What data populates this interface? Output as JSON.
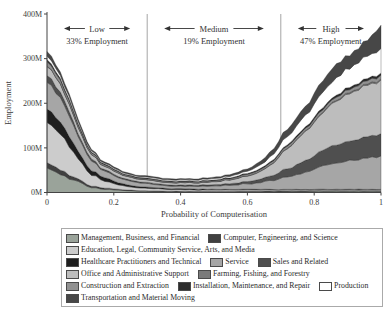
{
  "figure": {
    "annotations": [
      {
        "label": "Low",
        "sub": "33% Employment",
        "x_start": 0.0,
        "x_end": 0.3
      },
      {
        "label": "Medium",
        "sub": "19% Employment",
        "x_start": 0.3,
        "x_end": 0.7
      },
      {
        "label": "High",
        "sub": "47% Employment",
        "x_start": 0.7,
        "x_end": 1.0
      }
    ]
  },
  "chart_data": {
    "type": "area",
    "stacked": true,
    "title": "",
    "xlabel": "Probability of Computerisation",
    "ylabel": "Employment",
    "xlim": [
      0,
      1
    ],
    "ylim": [
      0,
      400
    ],
    "grid": false,
    "legend_position": "bottom",
    "dividers_x": [
      0.3,
      0.7
    ],
    "x_ticks": [
      {
        "v": 0.0,
        "label": "0"
      },
      {
        "v": 0.2,
        "label": "0.2"
      },
      {
        "v": 0.4,
        "label": "0.4"
      },
      {
        "v": 0.6,
        "label": "0.6"
      },
      {
        "v": 0.8,
        "label": "0.8"
      },
      {
        "v": 1.0,
        "label": "1"
      }
    ],
    "y_ticks": [
      {
        "v": 0,
        "label": "0M"
      },
      {
        "v": 100,
        "label": "100M"
      },
      {
        "v": 200,
        "label": "200M"
      },
      {
        "v": 300,
        "label": "300M"
      },
      {
        "v": 400,
        "label": "400M"
      }
    ],
    "x": [
      0,
      0.04,
      0.08,
      0.12,
      0.16,
      0.2,
      0.24,
      0.28,
      0.32,
      0.36,
      0.4,
      0.44,
      0.48,
      0.52,
      0.56,
      0.6,
      0.64,
      0.68,
      0.72,
      0.76,
      0.8,
      0.84,
      0.88,
      0.92,
      0.96,
      1.0
    ],
    "series": [
      {
        "key": "management",
        "name": "Management, Business, and Financial",
        "color": "#9aa39a",
        "values": [
          55,
          40,
          28,
          14,
          8,
          6,
          4,
          3,
          2.5,
          2,
          2,
          1.5,
          1.5,
          1.5,
          1.5,
          2,
          2,
          2,
          2.5,
          2.5,
          3,
          3,
          3,
          3,
          3,
          3
        ]
      },
      {
        "key": "computer",
        "name": "Computer, Engineering, and Science",
        "color": "#404040",
        "values": [
          12,
          10,
          7,
          4,
          3,
          2,
          1.5,
          1,
          1,
          1,
          0.8,
          0.8,
          0.8,
          0.8,
          0.8,
          1,
          1,
          1,
          1,
          1,
          1,
          1,
          1,
          1,
          1,
          1
        ]
      },
      {
        "key": "education",
        "name": "Education, Legal, Community Service, Arts, and Media",
        "color": "#cccccc",
        "values": [
          90,
          80,
          55,
          30,
          18,
          12,
          8,
          6,
          5,
          4,
          4,
          3.5,
          3,
          3,
          3,
          3,
          2.5,
          2.5,
          2.5,
          2,
          2,
          2,
          2,
          2,
          2,
          2
        ]
      },
      {
        "key": "healthcare",
        "name": "Healthcare Practitioners and Technical",
        "color": "#1e1e1e",
        "values": [
          30,
          28,
          20,
          12,
          8,
          6,
          4,
          3,
          2.5,
          2,
          2,
          2,
          1.5,
          1.5,
          1.5,
          1.5,
          1.5,
          1,
          1,
          1,
          1,
          1,
          1,
          1,
          1,
          1
        ]
      },
      {
        "key": "service",
        "name": "Service",
        "color": "#a6a6a6",
        "values": [
          60,
          55,
          40,
          25,
          15,
          12,
          10,
          8,
          7,
          6,
          6,
          6,
          7,
          8,
          10,
          12,
          15,
          20,
          28,
          35,
          45,
          55,
          60,
          65,
          70,
          75
        ]
      },
      {
        "key": "sales",
        "name": "Sales and Related",
        "color": "#4f4f4f",
        "values": [
          15,
          12,
          8,
          5,
          3,
          3,
          2.5,
          2.5,
          2.5,
          2.5,
          2.5,
          2.5,
          3,
          3,
          4,
          5,
          8,
          12,
          18,
          25,
          30,
          38,
          42,
          45,
          48,
          50
        ]
      },
      {
        "key": "office",
        "name": "Office and Administrative Support",
        "color": "#bdbdbd",
        "values": [
          20,
          18,
          14,
          10,
          8,
          7,
          6,
          6,
          6,
          5,
          5,
          5,
          6,
          7,
          9,
          12,
          18,
          28,
          45,
          60,
          75,
          90,
          100,
          110,
          115,
          120
        ]
      },
      {
        "key": "farming",
        "name": "Farming, Fishing, and Forestry",
        "color": "#7a7a7a",
        "values": [
          1,
          1,
          1,
          1,
          0.7,
          0.7,
          0.5,
          0.5,
          0.5,
          0.5,
          0.5,
          0.5,
          0.5,
          0.7,
          0.7,
          1,
          1,
          1.2,
          1.5,
          1.5,
          2,
          2,
          2.5,
          2.5,
          3,
          3
        ]
      },
      {
        "key": "construction",
        "name": "Construction and Extraction",
        "color": "#919191",
        "values": [
          10,
          8,
          6,
          4,
          3,
          2.5,
          2,
          2,
          2,
          2,
          2,
          2,
          2,
          2.2,
          2.5,
          3,
          3.2,
          4,
          4.5,
          5,
          5.5,
          6,
          6.5,
          7,
          7.5,
          8
        ]
      },
      {
        "key": "installation",
        "name": "Installation, Maintenance, and Repair",
        "color": "#2d2d2d",
        "values": [
          5,
          4,
          3,
          2,
          1.8,
          1.5,
          1.5,
          1.5,
          1.5,
          1.5,
          1.5,
          1.5,
          1.5,
          1.8,
          2,
          2.2,
          2.5,
          3,
          3.2,
          3.5,
          4,
          4.2,
          4.5,
          4.8,
          5,
          5
        ]
      },
      {
        "key": "production",
        "name": "Production",
        "color": "#ffffff",
        "values": [
          8,
          6,
          5,
          3,
          2,
          2,
          2,
          2,
          2.5,
          2.5,
          2.5,
          2.5,
          3,
          3,
          4,
          5,
          8,
          12,
          18,
          25,
          30,
          35,
          40,
          45,
          50,
          55
        ]
      },
      {
        "key": "transportation",
        "name": "Transportation and Material Moving",
        "color": "#474747",
        "values": [
          10,
          8,
          6,
          4,
          3,
          3,
          2.5,
          2.5,
          2.5,
          2.5,
          2.5,
          2.5,
          3,
          3,
          4,
          5,
          8,
          12,
          16,
          20,
          24,
          28,
          30,
          32,
          35,
          52
        ]
      }
    ]
  }
}
